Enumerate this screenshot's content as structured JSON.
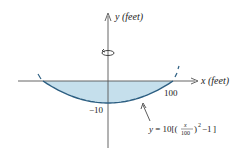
{
  "diagram": {
    "type": "solid-of-revolution",
    "y_axis_label": "y (feet)",
    "x_axis_label": "x (feet)",
    "tick_labels": {
      "x_tick": "100",
      "y_tick": "−10"
    },
    "curve": {
      "equation_prefix": "y = 10",
      "equation_fraction_num": "x",
      "equation_fraction_den": "100",
      "equation_exponent": "2",
      "equation_suffix": "−1",
      "x_range": [
        -100,
        100
      ],
      "vertex_y": -10
    },
    "rotation_symbol": "rotation-about-y-axis",
    "colors": {
      "fill": "#c5dfec",
      "curve": "#2d5f82",
      "axis": "#555555",
      "text": "#222222"
    }
  }
}
